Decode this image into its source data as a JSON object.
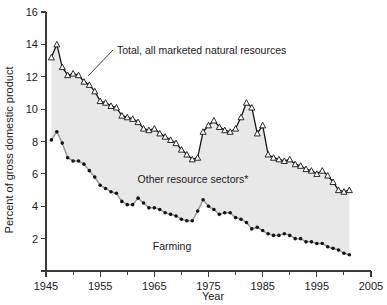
{
  "figure": {
    "background_color": "#ffffff",
    "band_fill_color": "#e8e8e8",
    "total_color": "#141414",
    "farming_color": "#141414",
    "farming_line_color": "#9a9a9a"
  },
  "annotations": {
    "total_label": "Total, all marketed natural resources",
    "other_label": "Other resource sectors*",
    "farming_label": "Farming"
  },
  "chart_data": {
    "type": "line",
    "title": "",
    "xlabel": "Year",
    "ylabel": "Percent of gross domestic product",
    "xlim": [
      1945,
      2005
    ],
    "ylim": [
      0,
      16
    ],
    "grid": false,
    "legend_position": "inline-annotations",
    "xticks": [
      1945,
      1955,
      1965,
      1975,
      1985,
      1995,
      2005
    ],
    "xtick_labels": [
      "1945",
      "1955",
      "1965",
      "1975",
      "1985",
      "1995",
      "2005"
    ],
    "xminor_ticks": [
      1950,
      1960,
      1970,
      1980,
      1990,
      2000
    ],
    "yticks": [
      0,
      2,
      4,
      6,
      8,
      10,
      12,
      14,
      16
    ],
    "ytick_labels": [
      "",
      "2",
      "4",
      "6",
      "8",
      "10",
      "12",
      "14",
      "16"
    ],
    "x": [
      1946,
      1947,
      1948,
      1949,
      1950,
      1951,
      1952,
      1953,
      1954,
      1955,
      1956,
      1957,
      1958,
      1959,
      1960,
      1961,
      1962,
      1963,
      1964,
      1965,
      1966,
      1967,
      1968,
      1969,
      1970,
      1971,
      1972,
      1973,
      1974,
      1975,
      1976,
      1977,
      1978,
      1979,
      1980,
      1981,
      1982,
      1983,
      1984,
      1985,
      1986,
      1987,
      1988,
      1989,
      1990,
      1991,
      1992,
      1993,
      1994,
      1995,
      1996,
      1997,
      1998,
      1999,
      2000,
      2001
    ],
    "series": [
      {
        "name": "Total, all marketed natural resources",
        "marker": "open-triangle",
        "values": [
          13.2,
          14.0,
          12.6,
          12.1,
          12.2,
          12.1,
          11.7,
          11.5,
          11.1,
          10.5,
          10.4,
          10.2,
          10.1,
          9.6,
          9.5,
          9.4,
          9.2,
          8.8,
          8.7,
          8.8,
          8.5,
          8.3,
          8.1,
          7.9,
          7.5,
          7.2,
          6.9,
          7.0,
          8.6,
          9.0,
          9.3,
          8.9,
          8.7,
          8.6,
          8.8,
          9.5,
          10.4,
          10.1,
          8.5,
          9.0,
          7.2,
          7.0,
          6.9,
          6.8,
          6.9,
          6.6,
          6.5,
          6.3,
          6.2,
          6.0,
          6.2,
          5.9,
          5.5,
          5.0,
          4.9,
          5.0
        ]
      },
      {
        "name": "Farming",
        "marker": "filled-circle",
        "values": [
          8.1,
          8.6,
          7.9,
          7.0,
          6.8,
          6.8,
          6.6,
          6.2,
          5.8,
          5.3,
          5.1,
          4.9,
          4.8,
          4.3,
          4.1,
          4.1,
          4.5,
          4.2,
          3.9,
          3.9,
          3.8,
          3.6,
          3.5,
          3.4,
          3.2,
          3.1,
          3.1,
          3.7,
          4.4,
          4.0,
          3.8,
          3.5,
          3.6,
          3.6,
          3.3,
          3.2,
          3.0,
          2.6,
          2.7,
          2.5,
          2.3,
          2.2,
          2.2,
          2.3,
          2.2,
          2.0,
          2.0,
          1.8,
          1.8,
          1.7,
          1.7,
          1.5,
          1.4,
          1.3,
          1.1,
          1.0
        ]
      }
    ]
  }
}
